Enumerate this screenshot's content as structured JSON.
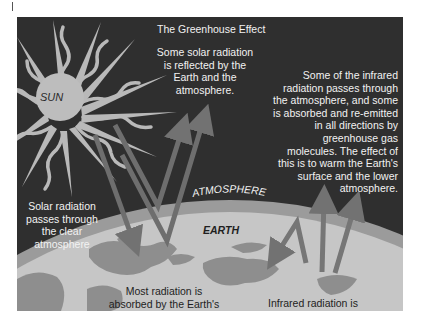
{
  "diagram": {
    "title": "The Greenhouse Effect",
    "labels": {
      "sun": "SUN",
      "atmosphere": "ATMOSPHERE",
      "earth": "EARTH"
    },
    "captions": {
      "reflected": [
        "Some solar radiation",
        "is reflected by the",
        "Earth and the",
        "atmosphere."
      ],
      "infrared": [
        "Some of the infrared",
        "radiation passes through",
        "the atmosphere, and some",
        "is absorbed and re-emitted",
        "in all directions by",
        "greenhouse gas",
        "molecules. The effect of",
        "this is to warm the Earth's",
        "surface and the lower",
        "atmosphere."
      ],
      "passes": [
        "Solar radiation",
        "passes through",
        "the clear",
        "atmosphere"
      ],
      "absorbed": [
        "Most radiation is",
        "absorbed by the Earth's",
        "surface and warms it."
      ],
      "emitted": [
        "Infrared radiation is",
        "emitted from the",
        "Earth's surface."
      ]
    },
    "colors": {
      "background": "#2f2f2f",
      "sun": "#b9b9b9",
      "atmosphere_band": "#9a9a9a",
      "earth_surface": "#c4c4c4",
      "land": "#8f8f8f",
      "solar_arrow": "#6f6f6f",
      "ir_arrow": "#757575"
    }
  }
}
